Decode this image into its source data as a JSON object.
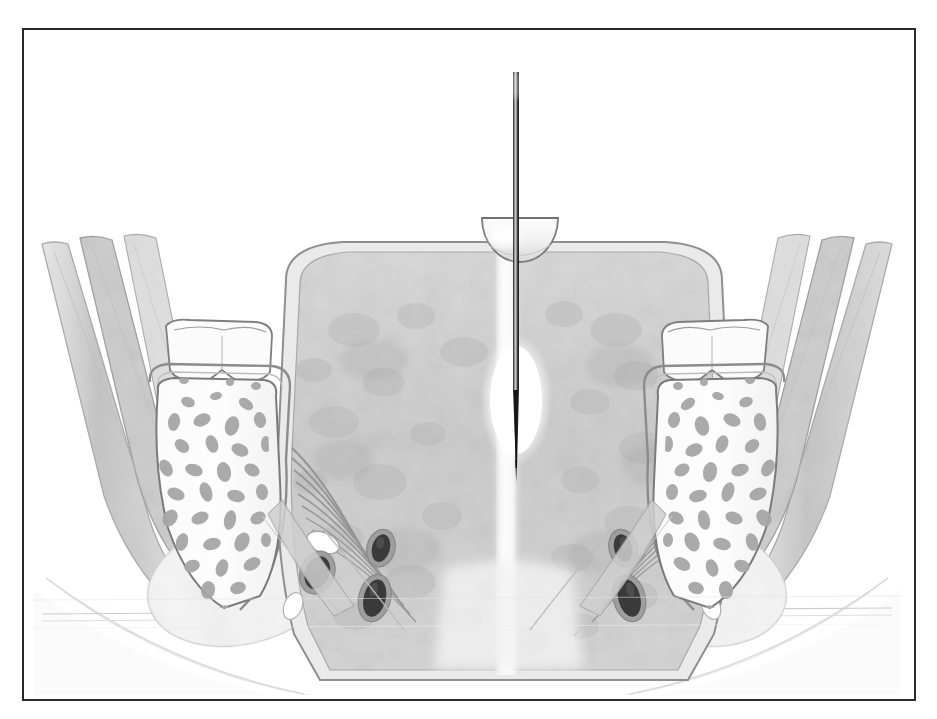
{
  "figure": {
    "modality": "medical line-and-wash anatomical illustration",
    "palette": "grayscale",
    "frame": {
      "border_color": "#2a2a2a",
      "background": "#ffffff",
      "x": 22,
      "y": 28,
      "width": 890,
      "height": 669
    },
    "canvas": {
      "width": 937,
      "height": 719
    }
  },
  "colors": {
    "frame_border": "#2a2a2a",
    "background": "#ffffff",
    "organ_fill": "#cfcfcf",
    "organ_capsule": "#e6e6e6",
    "organ_outline": "#8d8d8d",
    "muscle_fill": "#c6c6c6",
    "muscle_outline": "#9a9a9a",
    "fascia_fill": "#dcdcdc",
    "bone_cortex": "#f6f6f6",
    "bone_outline": "#7c7c7c",
    "trabeculae": "#a8a8a8",
    "cartilage": "#fbfbfb",
    "fat_fill": "#ededed",
    "vessel_dark": "#3a3a3a",
    "vessel_wall": "#9c9c9c",
    "nerve_white": "#ffffff",
    "needle_dark": "#1c1c1c",
    "needle_highlight": "#b9b9b9",
    "probe_fill": "#f4f4f4",
    "probe_outline": "#7d7d7d",
    "halo_white": "#ffffff",
    "midline": "#f2f2f2"
  },
  "instrument": {
    "needle": {
      "label": "needle",
      "top_y": 70,
      "tip_y": 466,
      "center_x": 518,
      "shaft_width_px": 6,
      "tip_taper_start_y": 360
    },
    "probe": {
      "label": "hemispherical transducer dome",
      "center_x": 518,
      "top_y": 216,
      "radius_px": 38,
      "shape": "hemisphere-flat-top"
    },
    "injectate_halo": {
      "label": "anechoic injectate halo",
      "center_x": 515,
      "center_y": 398,
      "rx": 34,
      "ry": 62
    }
  },
  "anatomy": {
    "central_organ": {
      "name": "prostate / rectal ampulla block",
      "top_y": 258,
      "bottom_y": 640,
      "left_x": 288,
      "right_x": 655,
      "has_capsule": true,
      "has_midline_raphe": true
    },
    "midline_raphe": {
      "name": "median raphe",
      "x": 500,
      "top_y": 262,
      "bottom_y": 680
    },
    "levator_fans": [
      {
        "side": "left",
        "origin_x": 330,
        "origin_y": 470,
        "fiber_count": 9
      },
      {
        "side": "right",
        "origin_x": 612,
        "origin_y": 470,
        "fiber_count": 9
      }
    ],
    "bones": [
      {
        "side": "left",
        "name": "ischium with trabecular marrow",
        "cartilage_cap": true,
        "cap_x": 162,
        "cap_y": 322,
        "cap_w": 98,
        "cap_h": 62,
        "body_x": 128,
        "body_y": 385,
        "body_w": 128,
        "body_h": 215,
        "trabecula_count": 58
      },
      {
        "side": "right",
        "name": "ischium with trabecular marrow",
        "cartilage_cap": true,
        "cap_x": 680,
        "cap_y": 322,
        "cap_w": 98,
        "cap_h": 62,
        "body_x": 688,
        "body_y": 385,
        "body_w": 128,
        "body_h": 215,
        "trabecula_count": 58
      }
    ],
    "lateral_muscle_bands": [
      {
        "side": "left",
        "name": "obturator internus / adductor bands",
        "band_count": 3
      },
      {
        "side": "right",
        "name": "obturator internus / adductor bands",
        "band_count": 3
      }
    ],
    "neurovascular_bundles": [
      {
        "side": "left",
        "group": "inner",
        "vessels": 2,
        "nerves": 1,
        "cx": 342,
        "cy": 560
      },
      {
        "side": "left",
        "group": "outer",
        "vessels": 1,
        "nerves": 2,
        "cx": 312,
        "cy": 552
      },
      {
        "side": "right",
        "group": "inner",
        "vessels": 2,
        "nerves": 1,
        "cx": 600,
        "cy": 560
      },
      {
        "side": "right",
        "group": "outer",
        "vessels": 1,
        "nerves": 2,
        "cx": 630,
        "cy": 552
      }
    ],
    "perineal_body": {
      "name": "perineal body / subcutaneous fat",
      "cy": 660
    },
    "skin_contour": {
      "name": "perineal skin contour",
      "cy": 612
    }
  }
}
